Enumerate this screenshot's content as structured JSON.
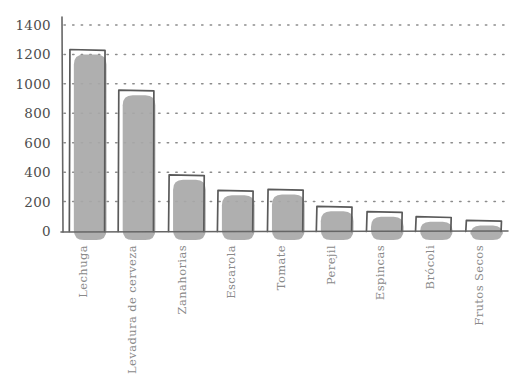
{
  "chart_data": {
    "type": "bar",
    "title": "",
    "subtitle": "",
    "xlabel": "",
    "ylabel": "",
    "categories": [
      "Lechuga",
      "Levadura de cerveza",
      "Zanahorias",
      "Escarola",
      "Tomate",
      "Perejil",
      "Espincas",
      "Brócoli",
      "Frutos Secos"
    ],
    "values": [
      1230,
      960,
      380,
      280,
      280,
      170,
      130,
      100,
      70
    ],
    "ylim": [
      0,
      1400
    ],
    "ytick_labels": [
      "0",
      "200",
      "400",
      "600",
      "800",
      "1000",
      "1200",
      "1400"
    ],
    "ytick_values": [
      0,
      200,
      400,
      600,
      800,
      1000,
      1200,
      1400
    ],
    "grid": "horizontal-dotted",
    "legend": "none",
    "style": "hand-drawn-sketch",
    "colors": {
      "bar_fill": "#a8a8a8",
      "bar_outline": "#5a5a5a",
      "axis": "#666666",
      "grid": "#8c8c8c",
      "tick_text": "#4d4d4d",
      "category_text": "#8a8a8a",
      "background": "#ffffff"
    }
  }
}
